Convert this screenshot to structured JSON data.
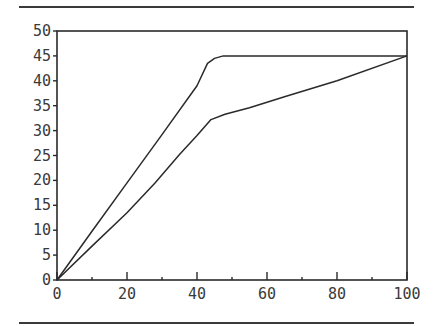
{
  "chart_data": {
    "type": "line",
    "title": "",
    "xlabel": "",
    "ylabel": "",
    "xlim": [
      0,
      100
    ],
    "ylim": [
      0,
      50
    ],
    "grid": false,
    "legend": null,
    "x_ticks": [
      0,
      20,
      40,
      60,
      80,
      100
    ],
    "y_ticks": [
      0,
      5,
      10,
      15,
      20,
      25,
      30,
      35,
      40,
      45,
      50
    ],
    "x_tick_labels": [
      "0",
      "20",
      "40",
      "60",
      "80",
      "100"
    ],
    "y_tick_labels": [
      "0",
      "5",
      "10",
      "15",
      "20",
      "25",
      "30",
      "35",
      "40",
      "45",
      "50"
    ],
    "series": [
      {
        "name": "upper",
        "x": [
          0,
          10,
          20,
          30,
          40,
          43,
          45,
          47.5,
          60,
          80,
          100
        ],
        "y": [
          0,
          9.8,
          19.5,
          29.2,
          39,
          43.5,
          44.5,
          45,
          45,
          45,
          45
        ]
      },
      {
        "name": "lower",
        "x": [
          0,
          10,
          20,
          28,
          35,
          40,
          44,
          48,
          55,
          65,
          80,
          100
        ],
        "y": [
          0,
          6.8,
          13.5,
          19.5,
          25.2,
          29,
          32.2,
          33.3,
          34.6,
          36.8,
          40,
          45
        ]
      }
    ]
  },
  "colors": {
    "line": "#2a2a2a",
    "axis": "#2a2a2a",
    "text": "#3a3a3a"
  }
}
